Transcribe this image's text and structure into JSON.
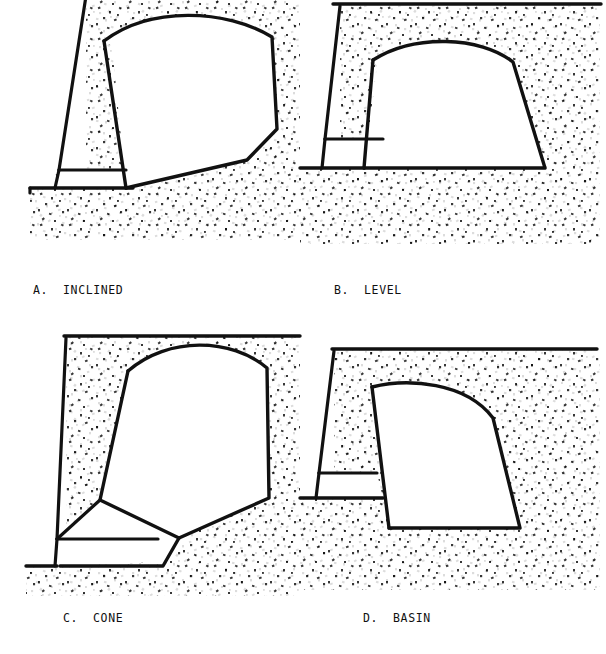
{
  "figure": {
    "background_color": "#ffffff",
    "line_color": "#111111",
    "stipple_color": "#151515",
    "void_fill": "#ffffff",
    "panel_count": 4
  },
  "panels": [
    {
      "id": "a",
      "letter": "A.",
      "name": "INCLINED",
      "caption": "A.  INCLINED",
      "floor_type": "inclined",
      "description": "Chamber with floor inclined downward toward the draw point at the left wall base"
    },
    {
      "id": "b",
      "letter": "B.",
      "name": "LEVEL",
      "caption": "B.  LEVEL",
      "floor_type": "level",
      "description": "Chamber with a flat, level floor at the draw level"
    },
    {
      "id": "c",
      "letter": "C.",
      "name": "CONE",
      "caption": "C.  CONE",
      "floor_type": "cone",
      "description": "Chamber with converging conical floor feeding a single central draw point"
    },
    {
      "id": "d",
      "letter": "D.",
      "name": "BASIN",
      "caption": "D.  BASIN",
      "floor_type": "basin",
      "description": "Chamber with floor recessed below the drift level forming a basin sump"
    }
  ],
  "geometry": {
    "panel_a": {
      "ground_line_y": 186,
      "ground_line_x_start": 30,
      "ground_line_x_end": 55,
      "wall_top_x": 86,
      "wall_base_x": 55,
      "drift_band_top_y": 168,
      "drift_band_bottom_y": 186,
      "chamber_outline": "M 103,40 C 150,6 225,10 272,36 L 277,128 L 248,160 L 126,188 L 112,45 Z",
      "overburden_right_edge": 300
    },
    "panel_b": {
      "ground_surface_y": 4,
      "ground_surface_x_start": 333,
      "ground_surface_x_end": 600,
      "wall_top_x": 340,
      "wall_base_x": 322,
      "drift_band_top_y": 137,
      "drift_band_bottom_y": 168,
      "floor_y": 168,
      "chamber_outline": "M 373,60 C 415,36 478,38 512,62 L 544,168 L 364,168 L 377,66 Z"
    },
    "panel_c": {
      "ground_surface_y": 336,
      "ground_surface_x_start": 66,
      "ground_surface_x_end": 300,
      "ground_line_y": 566,
      "wall_top_x": 66,
      "wall_base_x": 55,
      "drift_band_top_y": 538,
      "drift_band_bottom_y": 566,
      "cone_apex_x": 178,
      "cone_apex_y": 538,
      "chamber_outline": "M 127,371 C 168,338 230,340 266,368 L 268,498 L 178,538 L 100,500 Z"
    },
    "panel_d": {
      "ground_surface_y": 349,
      "ground_surface_x_start": 334,
      "ground_surface_x_end": 600,
      "ground_line_y": 498,
      "wall_top_x": 334,
      "wall_base_x": 316,
      "drift_band_top_y": 472,
      "drift_band_bottom_y": 498,
      "basin_floor_y": 528,
      "chamber_outline": "M 372,387 C 412,385 463,387 492,418 L 519,528 L 389,528 L 374,392 Z"
    }
  }
}
